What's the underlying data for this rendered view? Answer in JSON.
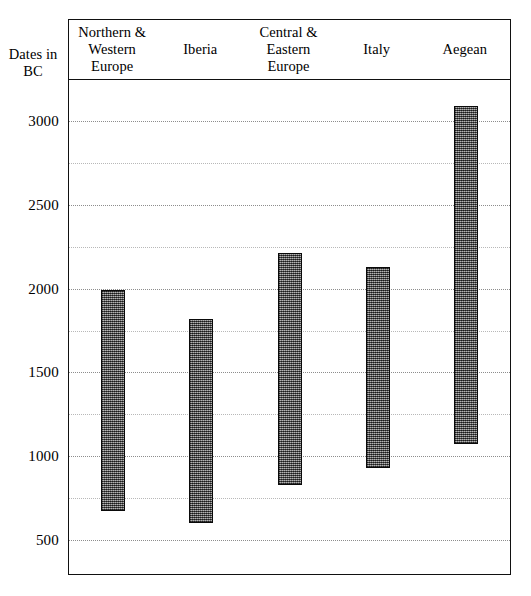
{
  "axis_title": "Dates in\nBC",
  "caption": "",
  "chart_data": {
    "type": "bar",
    "title": "",
    "subtitle": "",
    "xlabel": "",
    "ylabel": "Dates in BC",
    "ylim": [
      250,
      3250
    ],
    "yticks": [
      500,
      1000,
      1500,
      2000,
      2500,
      3000
    ],
    "ytick_labels": [
      "500",
      "1000",
      "1500",
      "2000",
      "2500",
      "3000"
    ],
    "minor_ticks": [
      750,
      1250,
      1750,
      2250,
      2750
    ],
    "grid": true,
    "grid_axis": "y",
    "legend": "none",
    "bar_style": {
      "fill": "#6f6f6f",
      "pattern": "stippled-dark-grey",
      "outline": "#0a0a0a"
    },
    "orientation": "vertical-range-bars",
    "categories": [
      "Northern &\nWestern Europe",
      "Iberia",
      "Central &\nEastern Europe",
      "Italy",
      "Aegean"
    ],
    "ranges": [
      {
        "category": "Northern & Western Europe",
        "start": 1990,
        "end": 670
      },
      {
        "category": "Iberia",
        "start": 1820,
        "end": 600
      },
      {
        "category": "Central & Eastern Europe",
        "start": 2210,
        "end": 830
      },
      {
        "category": "Italy",
        "start": 2130,
        "end": 930
      },
      {
        "category": "Aegean",
        "start": 3090,
        "end": 1070
      }
    ]
  }
}
